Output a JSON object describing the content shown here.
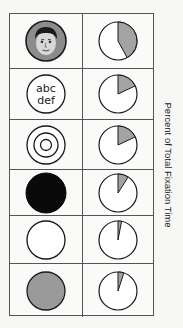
{
  "chart_data": {
    "type": "pie",
    "title": "",
    "ylabel": "Percent of Total Fixation Time",
    "layout": "6 rows x 2 columns table; left column shows stimulus type, right column shows pie of fixation share (shaded slice, starting at 12 o'clock, clockwise)",
    "categories": [
      "Face",
      "Text (abc def)",
      "Concentric circles",
      "Black circle",
      "White circle",
      "Gray circle"
    ],
    "series": [
      {
        "name": "Percent of Total Fixation Time",
        "values": [
          42,
          18,
          18,
          9,
          3,
          5
        ]
      }
    ],
    "colors": {
      "slice": "#a3a3a3",
      "background": "#ffffff",
      "stroke": "#222222"
    }
  },
  "rows": [
    {
      "stimulus": "face",
      "text": "",
      "percent": 42
    },
    {
      "stimulus": "text",
      "text_line1": "abc",
      "text_line2": "def",
      "percent": 18
    },
    {
      "stimulus": "concentric-circles",
      "text": "",
      "percent": 18
    },
    {
      "stimulus": "black-circle",
      "text": "",
      "percent": 9
    },
    {
      "stimulus": "white-circle",
      "text": "",
      "percent": 3
    },
    {
      "stimulus": "gray-circle",
      "text": "",
      "percent": 5
    }
  ],
  "axis_label": "Percent of Total Fixation Time"
}
